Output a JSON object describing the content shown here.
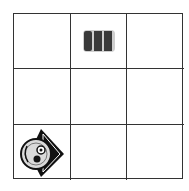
{
  "board": {
    "rows": 3,
    "cols": 3,
    "grid_color": "#333333",
    "cells": [
      {
        "row": 0,
        "col": 0,
        "piece": null
      },
      {
        "row": 0,
        "col": 1,
        "piece": "battery-block-icon"
      },
      {
        "row": 0,
        "col": 2,
        "piece": null
      },
      {
        "row": 1,
        "col": 0,
        "piece": null
      },
      {
        "row": 1,
        "col": 1,
        "piece": null
      },
      {
        "row": 1,
        "col": 2,
        "piece": null
      },
      {
        "row": 2,
        "col": 0,
        "piece": "disc-diamond-icon"
      },
      {
        "row": 2,
        "col": 1,
        "piece": null
      },
      {
        "row": 2,
        "col": 2,
        "piece": null
      }
    ]
  }
}
